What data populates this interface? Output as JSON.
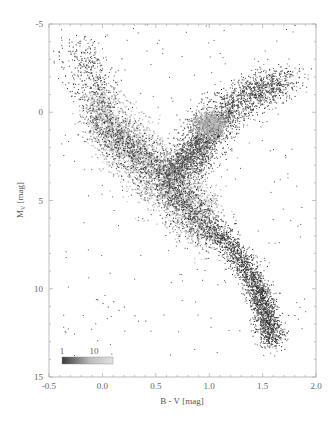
{
  "chart_data": {
    "type": "scatter",
    "subtype": "color-magnitude density diagram (Hertzsprung-Russell)",
    "title": "",
    "xlabel": "B - V [mag]",
    "ylabel": "M_V [mag]",
    "ylabel_main": "M",
    "ylabel_sub": "V",
    "ylabel_unit": " [mag]",
    "xlim": [
      -0.5,
      2.0
    ],
    "ylim": [
      15,
      -5
    ],
    "y_inverted": true,
    "xticks": [
      -0.5,
      0.0,
      0.5,
      1.0,
      1.5,
      2.0
    ],
    "xtick_labels": [
      "-0.5",
      "0.0",
      "0.5",
      "1.0",
      "1.5",
      "2.0"
    ],
    "yticks": [
      -5,
      0,
      5,
      10,
      15
    ],
    "ytick_labels": [
      "-5",
      "0",
      "5",
      "10",
      "15"
    ],
    "grid": false,
    "colorbar": {
      "position": "lower-left inside plot",
      "labels": [
        "1",
        "10"
      ],
      "colormap": "dark gray (low) to light gray (high)"
    },
    "point_color": "#222222",
    "density_color_high": "#d8d8d8",
    "series": [
      {
        "name": "Main sequence ridge",
        "points": [
          [
            -0.25,
            -4.0
          ],
          [
            -0.1,
            -2.0
          ],
          [
            0.0,
            0.5
          ],
          [
            0.2,
            1.8
          ],
          [
            0.4,
            2.8
          ],
          [
            0.6,
            4.2
          ],
          [
            0.8,
            5.5
          ],
          [
            1.0,
            6.6
          ],
          [
            1.2,
            7.6
          ],
          [
            1.35,
            8.8
          ],
          [
            1.45,
            10.0
          ],
          [
            1.5,
            11.0
          ],
          [
            1.55,
            12.0
          ],
          [
            1.6,
            13.0
          ]
        ]
      },
      {
        "name": "Giant branch ridge",
        "points": [
          [
            0.75,
            3.5
          ],
          [
            0.85,
            2.5
          ],
          [
            0.95,
            1.5
          ],
          [
            1.0,
            0.8
          ],
          [
            1.1,
            0.3
          ],
          [
            1.25,
            -0.5
          ],
          [
            1.4,
            -1.0
          ],
          [
            1.55,
            -1.5
          ],
          [
            1.7,
            -2.0
          ]
        ]
      },
      {
        "name": "Red clump",
        "points": [
          [
            1.0,
            0.7
          ]
        ]
      },
      {
        "name": "White dwarfs",
        "points": [
          [
            -0.05,
            10.6
          ],
          [
            0.0,
            10.8
          ],
          [
            0.05,
            11.0
          ],
          [
            0.1,
            10.7
          ],
          [
            0.15,
            11.2
          ],
          [
            0.2,
            11.0
          ],
          [
            0.3,
            11.5
          ],
          [
            0.4,
            11.8
          ]
        ]
      }
    ]
  }
}
